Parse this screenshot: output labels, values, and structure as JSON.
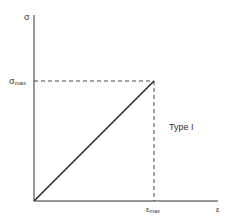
{
  "diagram": {
    "y_axis_label": "σ",
    "x_axis_label": "ε",
    "y_marker_label": {
      "base": "σ",
      "sub": "max"
    },
    "x_marker_label": {
      "base": "ε",
      "sub": "max"
    },
    "annotation": "Type I",
    "curve": {
      "type": "linear",
      "points": [
        {
          "x": 0,
          "y": 0
        },
        {
          "x": "ε_max",
          "y": "σ_max"
        }
      ]
    },
    "colors": {
      "line": "#2a2a2a",
      "text": "#333333",
      "background": "#ffffff"
    }
  }
}
